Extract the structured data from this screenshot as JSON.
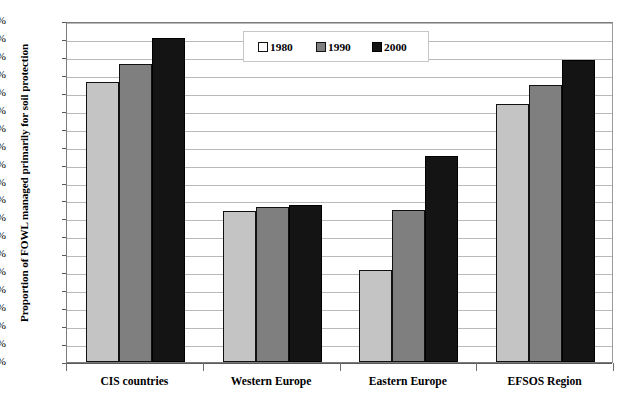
{
  "chart_data": {
    "type": "bar",
    "title": "",
    "xlabel": "",
    "ylabel": "Proportion of FOWL managed primarily for soil protection",
    "ylim": [
      0,
      19
    ],
    "ytick_step": 1,
    "ytick_labels": [
      "0%",
      "1%",
      "2%",
      "3%",
      "4%",
      "5%",
      "6%",
      "7%",
      "8%",
      "9%",
      "10%",
      "11%",
      "12%",
      "13%",
      "14%",
      "15%",
      "16%",
      "17%",
      "18%",
      "19%"
    ],
    "categories": [
      "CIS countries",
      "Western Europe",
      "Eastern Europe",
      "EFSOS Region"
    ],
    "series": [
      {
        "name": "1980",
        "color": "#c4c4c4",
        "values": [
          15.6,
          8.4,
          5.15,
          14.35
        ]
      },
      {
        "name": "1990",
        "color": "#7f7f7f",
        "values": [
          16.6,
          8.65,
          8.45,
          15.45
        ]
      },
      {
        "name": "2000",
        "color": "#141414",
        "values": [
          18.05,
          8.75,
          11.5,
          16.8
        ]
      }
    ],
    "grid": true,
    "legend_position": "top-center",
    "legend_entries": [
      "1980",
      "1990",
      "2000"
    ]
  },
  "title_sliver": "",
  "axis": {
    "y_title": "Proportion of FOWL managed primarily for soil protection"
  }
}
